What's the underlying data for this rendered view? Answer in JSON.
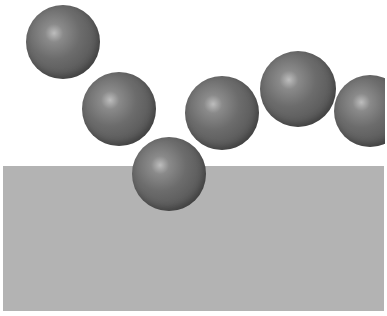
{
  "scene": {
    "background": "#ffffff",
    "slab": {
      "x": 3,
      "y": 166,
      "width": 381,
      "height": 145,
      "color": "#b3b3b3"
    },
    "spheres": [
      {
        "id": 1,
        "cx": 63,
        "cy": 42,
        "r": 37
      },
      {
        "id": 2,
        "cx": 119,
        "cy": 109,
        "r": 37
      },
      {
        "id": 3,
        "cx": 169,
        "cy": 174,
        "r": 37
      },
      {
        "id": 4,
        "cx": 222,
        "cy": 113,
        "r": 37
      },
      {
        "id": 5,
        "cx": 298,
        "cy": 89,
        "r": 38
      },
      {
        "id": 6,
        "cx": 370,
        "cy": 111,
        "r": 36
      }
    ],
    "sphere_color": "#5e5e5e"
  }
}
